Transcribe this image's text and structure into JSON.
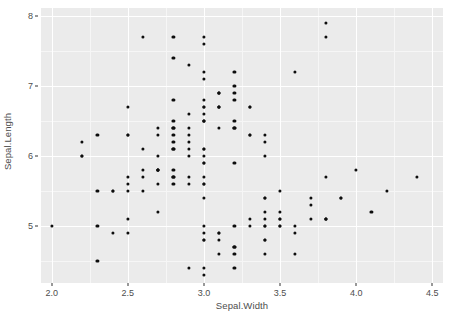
{
  "chart_data": {
    "type": "scatter",
    "title": "",
    "xlabel": "Sepal.Width",
    "ylabel": "Sepal.Length",
    "xlim": [
      1.93,
      4.57
    ],
    "ylim": [
      4.19,
      8.11
    ],
    "x_ticks": [
      "2.0",
      "2.5",
      "3.0",
      "3.5",
      "4.0",
      "4.5"
    ],
    "x_tick_values": [
      2.0,
      2.5,
      3.0,
      3.5,
      4.0,
      4.5
    ],
    "y_ticks": [
      "5",
      "6",
      "7",
      "8"
    ],
    "y_tick_values": [
      5,
      6,
      7,
      8
    ],
    "x_minor_values": [
      2.25,
      2.75,
      3.25,
      3.75,
      4.25
    ],
    "y_minor_values": [
      4.5,
      5.5,
      6.5,
      7.5
    ],
    "grid": true,
    "legend": "none",
    "panel_bg": "#ebebeb",
    "grid_major_color": "#ffffff",
    "grid_minor_color": "#f6f6f6",
    "point_color": "#0d0d0d",
    "point_size": 3.2,
    "axis_text_color": "#4d4d4d",
    "n_points": 150,
    "x": [
      3.5,
      3.0,
      3.2,
      3.1,
      3.6,
      3.9,
      3.4,
      3.4,
      2.9,
      3.1,
      3.7,
      3.4,
      3.0,
      3.0,
      4.0,
      4.4,
      3.9,
      3.5,
      3.8,
      3.8,
      3.4,
      3.7,
      3.6,
      3.3,
      3.4,
      3.0,
      3.4,
      3.5,
      3.4,
      3.2,
      3.1,
      3.4,
      4.1,
      4.2,
      3.1,
      3.2,
      3.5,
      3.6,
      3.0,
      3.4,
      3.5,
      2.3,
      3.2,
      3.5,
      3.8,
      3.0,
      3.8,
      3.2,
      3.7,
      3.3,
      3.2,
      3.2,
      3.1,
      2.3,
      2.8,
      2.8,
      3.3,
      2.4,
      2.9,
      2.7,
      2.0,
      3.0,
      2.2,
      2.9,
      2.9,
      3.1,
      3.0,
      2.7,
      2.2,
      2.5,
      3.2,
      2.8,
      2.5,
      2.8,
      2.9,
      3.0,
      2.8,
      3.0,
      2.9,
      2.6,
      2.4,
      2.4,
      2.7,
      2.7,
      3.0,
      3.4,
      3.1,
      2.3,
      3.0,
      2.5,
      2.6,
      3.0,
      2.6,
      2.3,
      2.7,
      3.0,
      2.9,
      2.9,
      2.5,
      2.8,
      3.3,
      2.7,
      3.0,
      2.9,
      3.0,
      3.0,
      2.5,
      2.9,
      2.5,
      3.6,
      3.2,
      2.7,
      3.0,
      2.5,
      2.8,
      3.2,
      3.0,
      3.8,
      2.6,
      2.2,
      3.2,
      2.8,
      2.8,
      2.7,
      3.3,
      3.2,
      2.8,
      3.0,
      2.8,
      3.0,
      2.8,
      3.8,
      2.8,
      2.8,
      2.6,
      3.0,
      3.4,
      3.1,
      3.0,
      3.1,
      3.1,
      3.1,
      2.7,
      3.2,
      3.3,
      3.0,
      2.5,
      3.0,
      3.4,
      3.0
    ],
    "y": [
      5.1,
      4.9,
      4.7,
      4.6,
      5.0,
      5.4,
      4.6,
      5.0,
      4.4,
      4.9,
      5.4,
      4.8,
      4.8,
      4.3,
      5.8,
      5.7,
      5.4,
      5.1,
      5.7,
      5.1,
      5.4,
      5.1,
      4.6,
      5.1,
      4.8,
      5.0,
      5.0,
      5.2,
      5.2,
      4.7,
      4.8,
      5.4,
      5.2,
      5.5,
      4.9,
      5.0,
      5.5,
      4.9,
      4.4,
      5.1,
      5.0,
      4.5,
      4.4,
      5.0,
      5.1,
      4.8,
      5.1,
      4.6,
      5.3,
      5.0,
      7.0,
      6.4,
      6.9,
      5.5,
      6.5,
      5.7,
      6.3,
      4.9,
      6.6,
      5.2,
      5.0,
      5.9,
      6.0,
      6.1,
      5.6,
      6.7,
      5.6,
      5.8,
      6.2,
      5.6,
      5.9,
      6.1,
      6.3,
      6.1,
      6.4,
      6.6,
      6.8,
      6.7,
      6.0,
      5.7,
      5.5,
      5.5,
      5.8,
      6.0,
      5.4,
      6.0,
      6.7,
      6.3,
      5.6,
      5.5,
      5.5,
      6.1,
      5.8,
      5.0,
      5.6,
      5.7,
      5.7,
      6.2,
      5.1,
      5.7,
      6.3,
      5.8,
      7.1,
      6.3,
      6.5,
      7.6,
      4.9,
      7.3,
      6.7,
      7.2,
      6.5,
      6.4,
      6.8,
      5.7,
      5.8,
      6.4,
      6.5,
      7.7,
      7.7,
      6.0,
      6.9,
      5.6,
      7.7,
      6.3,
      6.7,
      7.2,
      6.2,
      6.1,
      6.4,
      7.2,
      7.4,
      7.9,
      6.4,
      6.3,
      6.1,
      7.7,
      6.3,
      6.4,
      6.0,
      6.9,
      6.7,
      6.9,
      5.8,
      6.8,
      6.7,
      6.7,
      6.3,
      6.5,
      6.2,
      5.9
    ]
  }
}
